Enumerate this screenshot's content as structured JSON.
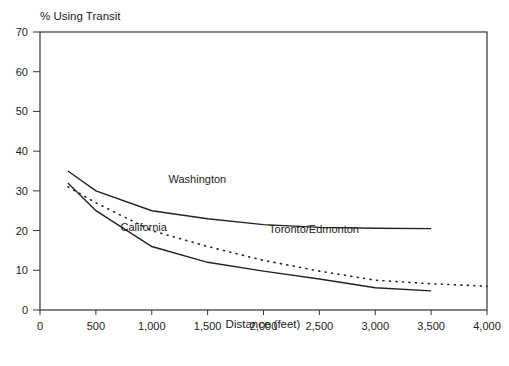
{
  "chart_data": {
    "type": "line",
    "title": "",
    "ylabel": "% Using Transit",
    "xlabel": "Distance (feet)",
    "xlim": [
      0,
      4000
    ],
    "ylim": [
      0,
      70
    ],
    "x_ticks": [
      0,
      500,
      1000,
      1500,
      2000,
      2500,
      3000,
      3500,
      4000
    ],
    "x_tick_labels": [
      "0",
      "500",
      "1,000",
      "1,500",
      "2,000",
      "2,500",
      "3,000",
      "3,500",
      "4,000"
    ],
    "y_ticks": [
      0,
      10,
      20,
      30,
      40,
      50,
      60,
      70
    ],
    "y_tick_labels": [
      "0",
      "10",
      "20",
      "30",
      "40",
      "50",
      "60",
      "70"
    ],
    "grid": false,
    "legend": "inline labels",
    "series": [
      {
        "name": "Washington",
        "style": "solid",
        "x": [
          250,
          500,
          1000,
          1500,
          2000,
          2500,
          3000,
          3500
        ],
        "values": [
          35,
          30,
          25,
          23,
          21.5,
          20.8,
          20.6,
          20.5
        ]
      },
      {
        "name": "California",
        "style": "solid",
        "x": [
          250,
          500,
          1000,
          1500,
          2000,
          2500,
          3000,
          3500
        ],
        "values": [
          32,
          25,
          16,
          12,
          9.8,
          7.8,
          5.6,
          4.8
        ]
      },
      {
        "name": "Toronto/Edmonton",
        "style": "dotted",
        "x": [
          250,
          500,
          1000,
          1500,
          2000,
          2500,
          3000,
          3500,
          4000
        ],
        "values": [
          31,
          27,
          20,
          16,
          12.5,
          9.8,
          7.5,
          6.6,
          6
        ]
      }
    ],
    "annotations": [
      {
        "text": "Washington",
        "x": 1150,
        "y": 32
      },
      {
        "text": "California",
        "x": 720,
        "y": 20
      },
      {
        "text": "Toronto/Edmonton",
        "x": 2050,
        "y": 19.5
      }
    ]
  }
}
